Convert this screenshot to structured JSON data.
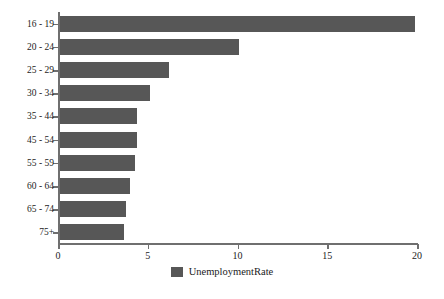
{
  "chart_data": {
    "type": "bar",
    "orientation": "horizontal",
    "title": "",
    "xlabel": "",
    "ylabel": "",
    "categories": [
      "16 - 19",
      "20 - 24",
      "25 - 29",
      "30 - 34",
      "35 - 44",
      "45 - 54",
      "55 - 59",
      "60 - 64",
      "65 - 74",
      "75+"
    ],
    "values": [
      19.9,
      10.1,
      6.2,
      5.1,
      4.4,
      4.4,
      4.3,
      4.0,
      3.8,
      3.7
    ],
    "series": [
      {
        "name": "UnemploymentRate",
        "values": [
          19.9,
          10.1,
          6.2,
          5.1,
          4.4,
          4.4,
          4.3,
          4.0,
          3.8,
          3.7
        ],
        "color": "#575757"
      }
    ],
    "xlim": [
      0,
      20
    ],
    "xticks": [
      0,
      5,
      10,
      15,
      20
    ],
    "xtick_labels": [
      "0",
      "5",
      "10",
      "15",
      "20"
    ],
    "grid": false,
    "legend": {
      "position": "bottom",
      "entries": [
        {
          "label": "UnemploymentRate",
          "color": "#575757"
        }
      ]
    },
    "axis_color": "#6f6f6f",
    "background": "#ffffff"
  }
}
